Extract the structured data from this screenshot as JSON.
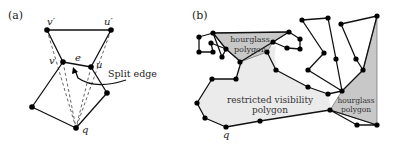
{
  "panel_a": {
    "label": "(a)",
    "vertex_labels": {
      "v_prime": "v′",
      "u_prime": "u′",
      "v": "v",
      "u": "u",
      "e": "e",
      "q": "q"
    },
    "annotation": "Split edge"
  },
  "panel_b": {
    "label": "(b)",
    "regions": {
      "hourglass_top_line1": "hourglass",
      "hourglass_top_line2": "polygon",
      "restricted_line1": "restricted visibility",
      "restricted_line2": "polygon",
      "hourglass_right_line1": "hourglass",
      "hourglass_right_line2": "polygon"
    },
    "vertex_labels": {
      "q": "q"
    }
  },
  "colors": {
    "edge": "#111111",
    "hourglass_fill": "#c8c8c8",
    "restricted_fill": "#ebebeb",
    "background": "#ffffff"
  }
}
